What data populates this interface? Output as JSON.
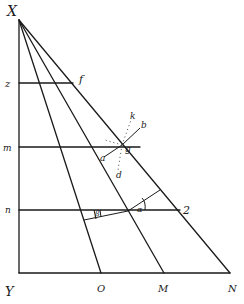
{
  "diagram": {
    "type": "geometric-construction",
    "background": "#ffffff",
    "ink_color": "#1a1a1a",
    "points": {
      "X": {
        "label": "X",
        "x": 19,
        "y": 20
      },
      "Y": {
        "label": "Y",
        "x": 19,
        "y": 273
      },
      "O": {
        "label": "O",
        "x": 101,
        "y": 273
      },
      "M": {
        "label": "M",
        "x": 164,
        "y": 273
      },
      "N": {
        "label": "N",
        "x": 230,
        "y": 273
      }
    },
    "labels": {
      "X": "X",
      "Y": "Y",
      "O": "O",
      "M": "M",
      "N": "N",
      "z": "z",
      "f": "f",
      "m": "m",
      "n": "n",
      "a": "a",
      "g": "g",
      "k": "k",
      "b": "b",
      "d": "d",
      "beta": "β",
      "alpha": "α",
      "two": "2"
    },
    "horizontal_levels": [
      {
        "name": "z",
        "y": 83
      },
      {
        "name": "m",
        "y": 147
      },
      {
        "name": "n",
        "y": 210
      }
    ],
    "rays_from_X": [
      "O",
      "M",
      "N",
      "inner"
    ]
  }
}
